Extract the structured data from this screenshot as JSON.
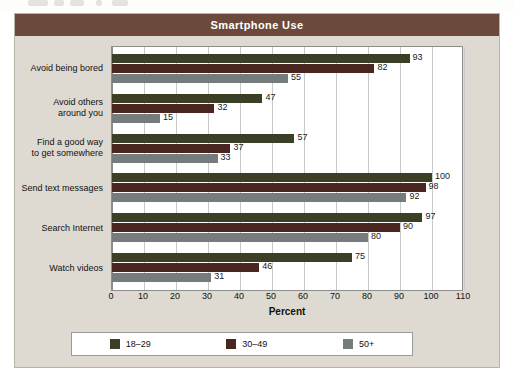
{
  "figure": {
    "title": "Smartphone Use",
    "colors": {
      "header_bar": "#6b4a3c",
      "panel_background": "#dedad2",
      "series_18_29": "#3a3f26",
      "series_30_49": "#4a2620",
      "series_50_plus": "#767b7d",
      "plot_background": "#ffffff"
    }
  },
  "chart_data": {
    "type": "bar",
    "orientation": "horizontal",
    "title": "Smartphone Use",
    "xlabel": "Percent",
    "ylabel": "",
    "xlim": [
      0,
      110
    ],
    "xticks": [
      0,
      10,
      20,
      30,
      40,
      50,
      60,
      70,
      80,
      90,
      100,
      110
    ],
    "grid": true,
    "legend_position": "bottom",
    "categories": [
      "Avoid being bored",
      "Avoid others around you",
      "Find a good way to get somewhere",
      "Send text messages",
      "Search Internet",
      "Watch videos"
    ],
    "series": [
      {
        "name": "18–29",
        "color": "#3a3f26",
        "values": [
          93,
          47,
          57,
          100,
          97,
          75
        ]
      },
      {
        "name": "30–49",
        "color": "#4a2620",
        "values": [
          82,
          32,
          37,
          98,
          90,
          46
        ]
      },
      {
        "name": "50+",
        "color": "#767b7d",
        "values": [
          55,
          15,
          33,
          92,
          80,
          31
        ]
      }
    ]
  },
  "category_labels": [
    {
      "line1": "Avoid being bored",
      "line2": ""
    },
    {
      "line1": "Avoid others",
      "line2": "around you"
    },
    {
      "line1": "Find a good way",
      "line2": "to get somewhere"
    },
    {
      "line1": "Send text messages",
      "line2": ""
    },
    {
      "line1": "Search Internet",
      "line2": ""
    },
    {
      "line1": "Watch videos",
      "line2": ""
    }
  ],
  "legend": {
    "items": [
      {
        "label": "18–29",
        "swatch": "s0"
      },
      {
        "label": "30–49",
        "swatch": "s1"
      },
      {
        "label": "50+",
        "swatch": "s2"
      }
    ]
  }
}
